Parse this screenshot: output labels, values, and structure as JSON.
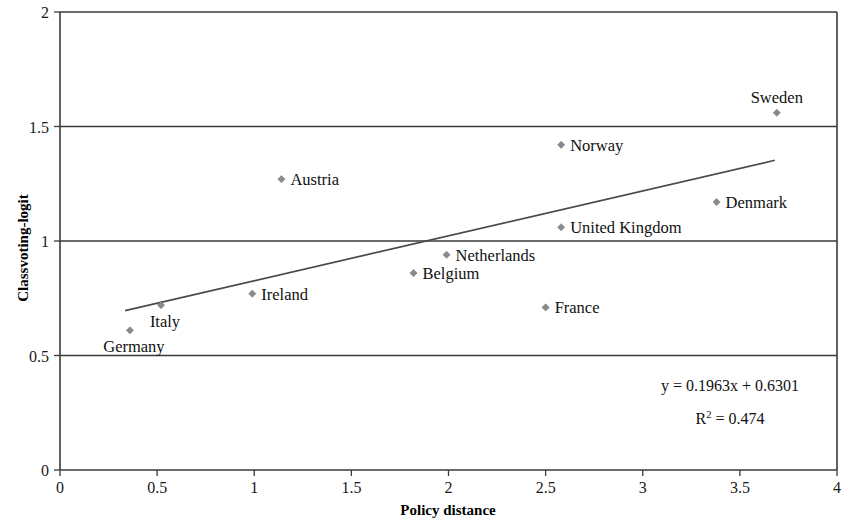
{
  "chart_data": {
    "type": "scatter",
    "title": "",
    "xlabel": "Policy distance",
    "ylabel": "Classvoting-logit",
    "xlim": [
      0,
      4
    ],
    "ylim": [
      0,
      2
    ],
    "xticks": [
      "0",
      "0.5",
      "1",
      "1.5",
      "2",
      "2.5",
      "3",
      "3.5",
      "4"
    ],
    "xtick_values": [
      0,
      0.5,
      1,
      1.5,
      2,
      2.5,
      3,
      3.5,
      4
    ],
    "yticks": [
      "0",
      "0.5",
      "1",
      "1.5",
      "2"
    ],
    "ytick_values": [
      0,
      0.5,
      1,
      1.5,
      2
    ],
    "grid": "horizontal",
    "legend": "none",
    "points": [
      {
        "label": "Germany",
        "x": 0.36,
        "y": 0.61,
        "label_pos": "below-right"
      },
      {
        "label": "Italy",
        "x": 0.52,
        "y": 0.72,
        "label_pos": "below-right"
      },
      {
        "label": "Ireland",
        "x": 0.99,
        "y": 0.77,
        "label_pos": "right"
      },
      {
        "label": "Austria",
        "x": 1.14,
        "y": 1.27,
        "label_pos": "right"
      },
      {
        "label": "Belgium",
        "x": 1.82,
        "y": 0.86,
        "label_pos": "right"
      },
      {
        "label": "Netherlands",
        "x": 1.99,
        "y": 0.94,
        "label_pos": "right"
      },
      {
        "label": "France",
        "x": 2.5,
        "y": 0.71,
        "label_pos": "right"
      },
      {
        "label": "United Kingdom",
        "x": 2.58,
        "y": 1.06,
        "label_pos": "right"
      },
      {
        "label": "Norway",
        "x": 2.58,
        "y": 1.42,
        "label_pos": "right"
      },
      {
        "label": "Denmark",
        "x": 3.38,
        "y": 1.17,
        "label_pos": "right"
      },
      {
        "label": "Sweden",
        "x": 3.69,
        "y": 1.56,
        "label_pos": "above"
      }
    ],
    "trendline": {
      "slope": 0.1963,
      "intercept": 0.6301,
      "x_start": 0.335,
      "x_end": 3.68
    },
    "annotations": {
      "equation": "y = 0.1963x + 0.6301",
      "r_squared_prefix": "R",
      "r_squared_exponent": "2",
      "r_squared_value": " = 0.474"
    },
    "colors": {
      "marker": "#8a8a8a",
      "line": "#4a4a4a",
      "axis": "#3a3a3a",
      "text": "#111111",
      "background": "#ffffff"
    }
  }
}
